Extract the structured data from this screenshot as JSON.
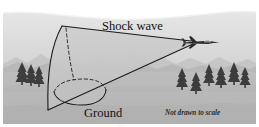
{
  "figure": {
    "labels": {
      "shock_wave": "Shock wave",
      "ground": "Ground",
      "not_to_scale": "Not drawn to scale"
    },
    "colors": {
      "page_background": "#ffffff",
      "sky_upper": "#ececec",
      "sky_lower": "#d7d7d7",
      "mountain_far": "#c2c2c2",
      "mountain_near": "#b5b5b5",
      "ground": "#b9b9b9",
      "ground_shadow": "#ababab",
      "cone_fill": "#c6c6c6",
      "line": "#1a1a1a",
      "tree": "#3a3a3a",
      "aircraft": "#2b2b2b",
      "text": "#111111"
    },
    "scene": {
      "frame": {
        "x": 3,
        "y": 3,
        "width": 253,
        "height": 121
      },
      "horizon_y": 72,
      "cloud_band_y": 18
    },
    "aircraft": {
      "name": "supersonic-jet",
      "x": 193,
      "y": 42,
      "heading": "right"
    },
    "cone": {
      "apex": {
        "x": 48,
        "y": 110
      },
      "top_edge_from": {
        "x": 62,
        "y": 26
      },
      "top_edge_to": {
        "x": 191,
        "y": 41
      },
      "bottom_edge_to": {
        "x": 193,
        "y": 44
      },
      "ellipse_center": {
        "x": 80,
        "y": 92
      },
      "ellipse_rx": 26,
      "ellipse_ry": 13
    },
    "trees": {
      "left_cluster_count": 3,
      "right_cluster_count": 6
    }
  }
}
